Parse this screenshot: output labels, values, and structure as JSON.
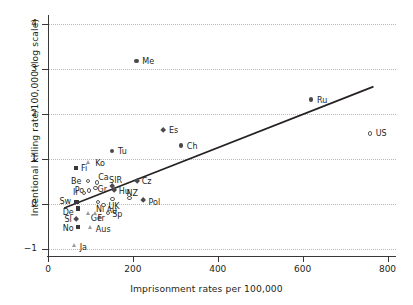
{
  "chart_data": {
    "type": "scatter",
    "title": "",
    "xlabel": "Imprisonment rates per 100,000",
    "ylabel": "Intentional killing rate/100,000 (log scale)",
    "xlim": [
      0,
      820
    ],
    "ylim": [
      -1.15,
      4.15
    ],
    "xticks": [
      0,
      200,
      400,
      600,
      800
    ],
    "yticks": [
      -1,
      0,
      1,
      2,
      3,
      4
    ],
    "xticklabels": [
      "0",
      "200",
      "400",
      "600",
      "800"
    ],
    "yticklabels": [
      "−1",
      "0",
      "1",
      "2",
      "3",
      "4"
    ],
    "grid": "horizontal-dotted",
    "legend": "none",
    "trendline": {
      "x0": 40,
      "y0": -0.08,
      "x1": 765,
      "y1": 2.6
    },
    "points": [
      {
        "label": "Me",
        "x": 208,
        "y": 3.17,
        "marker": "circle-fill",
        "lx": 6,
        "ly": -4
      },
      {
        "label": "Ru",
        "x": 620,
        "y": 2.32,
        "marker": "circle-fill",
        "lx": 6,
        "ly": -4
      },
      {
        "label": "US",
        "x": 758,
        "y": 1.57,
        "marker": "circle-open",
        "lx": 6,
        "ly": -4
      },
      {
        "label": "Es",
        "x": 271,
        "y": 1.64,
        "marker": "diamond-fill",
        "lx": 6,
        "ly": -4
      },
      {
        "label": "Ch",
        "x": 313,
        "y": 1.3,
        "marker": "circle-fill",
        "lx": 6,
        "ly": -4
      },
      {
        "label": "Tu",
        "x": 151,
        "y": 1.18,
        "marker": "circle-fill",
        "lx": 6,
        "ly": -4
      },
      {
        "label": "Ko",
        "x": 97,
        "y": 0.92,
        "marker": "triangle-open",
        "lx": 6,
        "ly": -4
      },
      {
        "label": "Fi",
        "x": 66,
        "y": 0.8,
        "marker": "square-fill",
        "lx": 5,
        "ly": -4
      },
      {
        "label": "Be",
        "x": 94,
        "y": 0.52,
        "marker": "circle-open",
        "lx": -17,
        "ly": -4
      },
      {
        "label": "Ca",
        "x": 116,
        "y": 0.48,
        "marker": "circle-open",
        "lx": 1,
        "ly": -9
      },
      {
        "label": "SlR",
        "x": 151,
        "y": 0.4,
        "marker": "diamond-fill",
        "lx": -3,
        "ly": -10
      },
      {
        "label": "Cz",
        "x": 209,
        "y": 0.52,
        "marker": "diamond-fill",
        "lx": 5,
        "ly": -4
      },
      {
        "label": "Gr",
        "x": 112,
        "y": 0.36,
        "marker": "circle-open",
        "lx": 2,
        "ly": -3
      },
      {
        "label": "Po",
        "x": 96,
        "y": 0.3,
        "marker": "circle-open",
        "lx": -14,
        "ly": -5
      },
      {
        "label": "Ir",
        "x": 85,
        "y": 0.25,
        "marker": "circle-open",
        "lx": -11,
        "ly": -5
      },
      {
        "label": "Hu",
        "x": 157,
        "y": 0.3,
        "marker": "diamond-fill",
        "lx": 4,
        "ly": -4
      },
      {
        "label": "NZ",
        "x": 192,
        "y": 0.13,
        "marker": "circle-open",
        "lx": -3,
        "ly": -9
      },
      {
        "label": "Pol",
        "x": 225,
        "y": 0.08,
        "marker": "diamond-fill",
        "lx": 5,
        "ly": -3
      },
      {
        "label": "UK",
        "x": 152,
        "y": 0.12,
        "marker": "circle-open",
        "lx": -4,
        "ly": 3
      },
      {
        "label": "Sw",
        "x": 67,
        "y": 0.05,
        "marker": "square-fill",
        "lx": -17,
        "ly": -5
      },
      {
        "label": "Nl",
        "x": 118,
        "y": 0.05,
        "marker": "circle-open",
        "lx": -2,
        "ly": 3
      },
      {
        "label": "Au",
        "x": 131,
        "y": -0.02,
        "marker": "circle-open",
        "lx": 3,
        "ly": 1
      },
      {
        "label": "De",
        "x": 70,
        "y": -0.1,
        "marker": "square-fill",
        "lx": -15,
        "ly": -1
      },
      {
        "label": "Ge",
        "x": 96,
        "y": -0.2,
        "marker": "triangle-open",
        "lx": 2,
        "ly": 1
      },
      {
        "label": "Fr",
        "x": 112,
        "y": -0.2,
        "marker": "triangle-open",
        "lx": 2,
        "ly": 1
      },
      {
        "label": "Sp",
        "x": 142,
        "y": -0.2,
        "marker": "circle-open",
        "lx": 4,
        "ly": -3
      },
      {
        "label": "Sl",
        "x": 67,
        "y": -0.34,
        "marker": "diamond-fill",
        "lx": -12,
        "ly": -4
      },
      {
        "label": "No",
        "x": 70,
        "y": -0.5,
        "marker": "square-fill",
        "lx": -15,
        "ly": -3
      },
      {
        "label": "Aus",
        "x": 101,
        "y": -0.52,
        "marker": "triangle-open",
        "lx": 5,
        "ly": -3
      },
      {
        "label": "Ja",
        "x": 63,
        "y": -0.93,
        "marker": "triangle-open",
        "lx": 5,
        "ly": -3
      }
    ]
  }
}
